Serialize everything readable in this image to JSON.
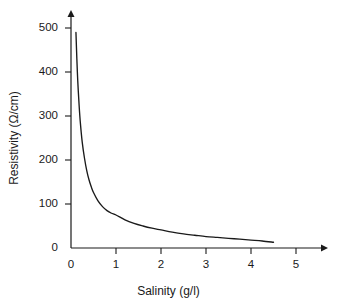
{
  "chart_data": {
    "type": "line",
    "title": "",
    "xlabel": "Salinity (g/l)",
    "ylabel": "Resistivity (Ω/cm)",
    "xlim": [
      0,
      5.3
    ],
    "ylim": [
      0,
      530
    ],
    "xticks": [
      "0",
      "1",
      "2",
      "3",
      "4",
      "5"
    ],
    "xtick_values": [
      0,
      1,
      2,
      3,
      4,
      5
    ],
    "yticks": [
      "0",
      "100",
      "200",
      "300",
      "400",
      "500"
    ],
    "ytick_values": [
      0,
      100,
      200,
      300,
      400,
      500
    ],
    "grid": false,
    "legend": "none",
    "axis_arrows": true,
    "series": [
      {
        "name": "Resistivity vs Salinity",
        "color": "#1a1a1a",
        "x": [
          0.11,
          0.13,
          0.15,
          0.18,
          0.21,
          0.25,
          0.3,
          0.35,
          0.4,
          0.45,
          0.5,
          0.6,
          0.7,
          0.8,
          0.9,
          1.0,
          1.2,
          1.4,
          1.6,
          1.8,
          2.0,
          2.25,
          2.5,
          2.75,
          3.0,
          3.25,
          3.5,
          3.75,
          4.0,
          4.25,
          4.5
        ],
        "y": [
          490,
          430,
          380,
          325,
          282,
          240,
          204,
          176,
          155,
          139,
          126,
          107,
          94,
          85,
          79,
          75,
          64,
          56,
          50,
          45,
          41,
          36,
          32,
          29,
          26,
          24,
          22,
          20,
          18,
          16,
          13
        ]
      }
    ]
  },
  "axes": {
    "x_tick_labels": [
      "0",
      "1",
      "2",
      "3",
      "4",
      "5"
    ],
    "y_tick_labels": [
      "0",
      "100",
      "200",
      "300",
      "400",
      "500"
    ],
    "x_title": "Salinity (g/l)",
    "y_title": "Resistivity (Ω/cm)"
  }
}
